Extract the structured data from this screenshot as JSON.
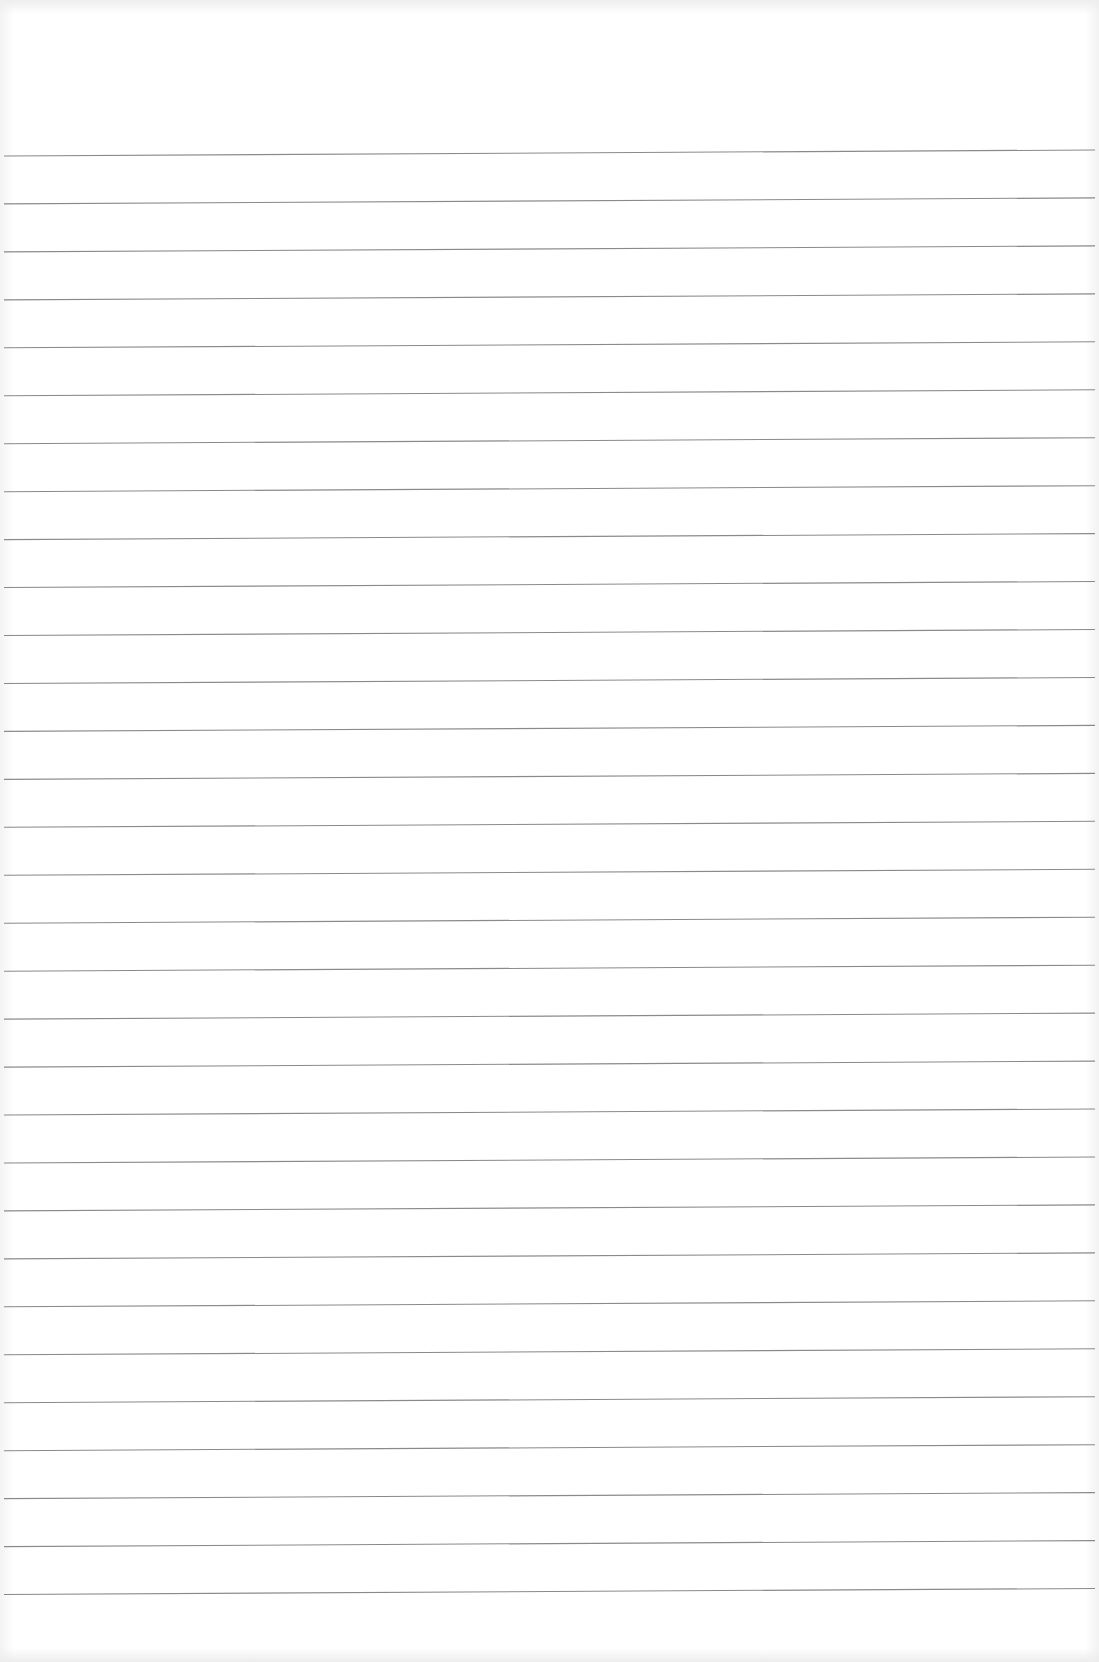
{
  "page": {
    "type": "blank ruled notebook paper",
    "background_color": "#ffffff",
    "rule_color": "#8a8a8a",
    "rule_count": 31,
    "first_rule_y_left": 156,
    "first_rule_y_right": 150,
    "rule_spacing_px": 47.95,
    "content_text": ""
  }
}
